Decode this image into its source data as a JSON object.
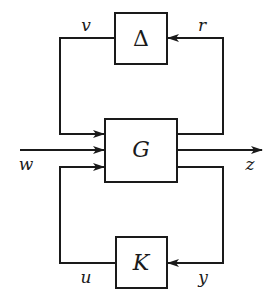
{
  "diagram": {
    "type": "block-diagram",
    "title": "",
    "blocks": {
      "delta": {
        "label": "Δ"
      },
      "plant": {
        "label": "G"
      },
      "controller": {
        "label": "K"
      }
    },
    "signals": {
      "v": "v",
      "r": "r",
      "w": "w",
      "z": "z",
      "u": "u",
      "y": "y"
    },
    "edges": [
      {
        "from": "delta",
        "to": "plant",
        "signal": "v"
      },
      {
        "from": "plant",
        "to": "delta",
        "signal": "r"
      },
      {
        "from": "external",
        "to": "plant",
        "signal": "w"
      },
      {
        "from": "plant",
        "to": "external",
        "signal": "z"
      },
      {
        "from": "controller",
        "to": "plant",
        "signal": "u"
      },
      {
        "from": "plant",
        "to": "controller",
        "signal": "y"
      }
    ],
    "colors": {
      "stroke": "#1a1a1a",
      "background": "#ffffff"
    }
  }
}
